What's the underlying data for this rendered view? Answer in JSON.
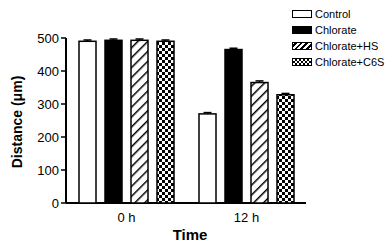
{
  "chart_data": {
    "type": "bar",
    "title": "",
    "xlabel": "Time",
    "ylabel": "Distance (μm)",
    "ylim": [
      0,
      500
    ],
    "yticks": [
      0,
      100,
      200,
      300,
      400,
      500
    ],
    "categories": [
      "0 h",
      "12 h"
    ],
    "series": [
      {
        "name": "Control",
        "pattern": "white",
        "values": [
          490,
          270
        ],
        "errors": [
          4,
          4
        ]
      },
      {
        "name": "Chlorate",
        "pattern": "black",
        "values": [
          493,
          465
        ],
        "errors": [
          4,
          4
        ]
      },
      {
        "name": "Chlorate+HS",
        "pattern": "hatch",
        "values": [
          493,
          365
        ],
        "errors": [
          4,
          5
        ]
      },
      {
        "name": "Chlorate+C6S",
        "pattern": "checker",
        "values": [
          490,
          328
        ],
        "errors": [
          4,
          4
        ]
      }
    ],
    "grid": false,
    "legend_position": "top-right"
  },
  "legend": {
    "items": [
      {
        "label": "Control"
      },
      {
        "label": "Chlorate"
      },
      {
        "label": "Chlorate+HS"
      },
      {
        "label": "Chlorate+C6S"
      }
    ]
  }
}
